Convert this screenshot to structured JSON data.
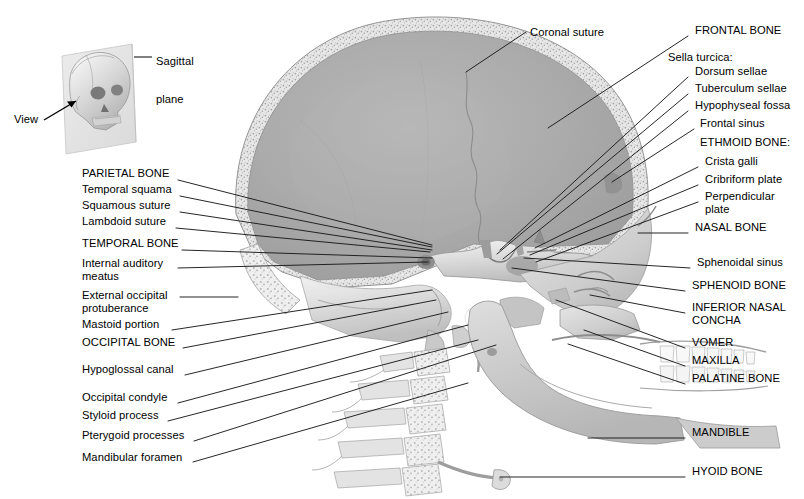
{
  "figure": {
    "view_type": "midsagittal section, medial view of right half",
    "inset": {
      "name": "orientation-inset",
      "plane_label": "Sagittal\nplane",
      "plane_label_lines": [
        "Sagittal",
        "plane"
      ],
      "view_label": "View",
      "description": "three-quarter view skull intersected by a vertical sagittal plane"
    },
    "colors": {
      "background": "#ffffff",
      "leader_line": "#1a1a1a",
      "text": "#000000",
      "cranial_cavity_fill": "#a9a9a9",
      "bone_light": "#e8e8e8",
      "bone_mid": "#cfcfcf",
      "bone_dark": "#9a9a9a",
      "diploe_speckle": "#b5b5b5",
      "plane_panel": "#e3e3e3",
      "tooth_white": "#f7f7f7"
    }
  },
  "labels": {
    "top": [
      {
        "id": "coronal-suture",
        "text": "Coronal suture",
        "side": "top",
        "text_x": 530,
        "text_y": 35,
        "line": [
          [
            526,
            32
          ],
          [
            466,
            72
          ]
        ]
      }
    ],
    "left": [
      {
        "id": "parietal-bone",
        "text": "PARIETAL BONE",
        "emphasis": "caps",
        "text_x": 82,
        "text_y": 176,
        "line": [
          [
            178,
            180
          ],
          [
            432,
            245
          ]
        ]
      },
      {
        "id": "temporal-squama",
        "text": "Temporal squama",
        "emphasis": "normal",
        "text_x": 82,
        "text_y": 192,
        "line": [
          [
            180,
            196
          ],
          [
            432,
            247
          ]
        ]
      },
      {
        "id": "squamous-suture",
        "text": "Squamous suture",
        "emphasis": "normal",
        "text_x": 82,
        "text_y": 208,
        "line": [
          [
            180,
            212
          ],
          [
            432,
            250
          ]
        ]
      },
      {
        "id": "lambdoid-suture",
        "text": "Lambdoid suture",
        "emphasis": "normal",
        "text_x": 82,
        "text_y": 224,
        "line": [
          [
            176,
            228
          ],
          [
            430,
            252
          ]
        ]
      },
      {
        "id": "temporal-bone",
        "text": "TEMPORAL BONE",
        "emphasis": "caps",
        "text_x": 82,
        "text_y": 246,
        "line": [
          [
            182,
            250
          ],
          [
            432,
            258
          ]
        ]
      },
      {
        "id": "internal-auditory-meatus",
        "text": "Internal auditory\nmeatus",
        "emphasis": "normal",
        "lines": [
          "Internal auditory",
          "meatus"
        ],
        "text_x": 82,
        "text_y": 266,
        "line": [
          [
            178,
            268
          ],
          [
            428,
            262
          ]
        ]
      },
      {
        "id": "external-occipital-protuberance",
        "text": "External occipital\nprotuberance",
        "emphasis": "normal",
        "lines": [
          "External occipital",
          "protuberance"
        ],
        "text_x": 82,
        "text_y": 298,
        "line": [
          [
            180,
            297
          ],
          [
            238,
            297
          ]
        ]
      },
      {
        "id": "mastoid-portion",
        "text": "Mastoid portion",
        "emphasis": "normal",
        "text_x": 82,
        "text_y": 327,
        "line": [
          [
            172,
            330
          ],
          [
            432,
            290
          ]
        ]
      },
      {
        "id": "occipital-bone",
        "text": "OCCIPITAL BONE",
        "emphasis": "caps",
        "text_x": 82,
        "text_y": 345,
        "line": [
          [
            183,
            348
          ],
          [
            436,
            300
          ]
        ]
      },
      {
        "id": "hypoglossal-canal",
        "text": "Hypoglossal canal",
        "emphasis": "normal",
        "text_x": 82,
        "text_y": 372,
        "line": [
          [
            185,
            375
          ],
          [
            448,
            312
          ]
        ]
      },
      {
        "id": "occipital-condyle",
        "text": "Occipital condyle",
        "emphasis": "normal",
        "text_x": 82,
        "text_y": 400,
        "line": [
          [
            178,
            403
          ],
          [
            468,
            325
          ]
        ]
      },
      {
        "id": "styloid-process",
        "text": "Styloid process",
        "emphasis": "normal",
        "text_x": 82,
        "text_y": 418,
        "line": [
          [
            168,
            421
          ],
          [
            478,
            340
          ]
        ]
      },
      {
        "id": "pterygoid-processes",
        "text": "Pterygoid processes",
        "emphasis": "normal",
        "text_x": 82,
        "text_y": 438,
        "line": [
          [
            194,
            441
          ],
          [
            496,
            345
          ]
        ]
      },
      {
        "id": "mandibular-foramen",
        "text": "Mandibular foramen",
        "emphasis": "normal",
        "text_x": 82,
        "text_y": 460,
        "line": [
          [
            193,
            462
          ],
          [
            468,
            383
          ]
        ]
      }
    ],
    "right": [
      {
        "id": "frontal-bone",
        "text": "FRONTAL BONE",
        "emphasis": "caps",
        "indent": 0,
        "text_x": 695,
        "text_y": 33,
        "line": [
          [
            688,
            36
          ],
          [
            548,
            128
          ]
        ]
      },
      {
        "id": "sella-turcica-group",
        "text": "Sella turcica:",
        "emphasis": "normal",
        "indent": 1,
        "is_group_header": true,
        "text_x": 668,
        "text_y": 60,
        "line": null
      },
      {
        "id": "dorsum-sellae",
        "text": "Dorsum sellae",
        "emphasis": "normal",
        "indent": 2,
        "text_x": 695,
        "text_y": 74,
        "line": [
          [
            688,
            77
          ],
          [
            500,
            250
          ]
        ]
      },
      {
        "id": "tuberculum-sellae",
        "text": "Tuberculum sellae",
        "emphasis": "normal",
        "indent": 2,
        "text_x": 695,
        "text_y": 91,
        "line": [
          [
            688,
            94
          ],
          [
            497,
            254
          ]
        ]
      },
      {
        "id": "hypophyseal-fossa",
        "text": "Hypophyseal fossa",
        "emphasis": "normal",
        "indent": 2,
        "text_x": 695,
        "text_y": 108,
        "line": [
          [
            688,
            111
          ],
          [
            503,
            259
          ]
        ]
      },
      {
        "id": "frontal-sinus",
        "text": "Frontal sinus",
        "emphasis": "normal",
        "indent": 3,
        "text_x": 700,
        "text_y": 126,
        "line": [
          [
            694,
            129
          ],
          [
            612,
            182
          ]
        ]
      },
      {
        "id": "ethmoid-bone-group",
        "text": "ETHMOID BONE:",
        "emphasis": "caps",
        "indent": 3,
        "is_group_header": true,
        "text_x": 700,
        "text_y": 145,
        "line": null
      },
      {
        "id": "crista-galli",
        "text": "Crista galli",
        "emphasis": "normal",
        "indent": 4,
        "text_x": 705,
        "text_y": 164,
        "line": [
          [
            698,
            167
          ],
          [
            535,
            248
          ]
        ]
      },
      {
        "id": "cribriform-plate",
        "text": "Cribriform plate",
        "emphasis": "normal",
        "indent": 4,
        "text_x": 705,
        "text_y": 182,
        "line": [
          [
            698,
            185
          ],
          [
            530,
            255
          ]
        ]
      },
      {
        "id": "perpendicular-plate",
        "text": "Perpendicular\nplate",
        "emphasis": "normal",
        "indent": 4,
        "lines": [
          "Perpendicular",
          "plate"
        ],
        "text_x": 705,
        "text_y": 199,
        "line": [
          [
            698,
            202
          ],
          [
            536,
            262
          ]
        ]
      },
      {
        "id": "nasal-bone",
        "text": "NASAL BONE",
        "emphasis": "caps",
        "indent": 3,
        "text_x": 695,
        "text_y": 230,
        "line": [
          [
            688,
            233
          ],
          [
            638,
            233
          ]
        ]
      },
      {
        "id": "sphenoidal-sinus",
        "text": "Sphenoidal sinus",
        "emphasis": "normal",
        "indent": 3,
        "text_x": 697,
        "text_y": 265,
        "line": [
          [
            690,
            268
          ],
          [
            524,
            258
          ]
        ]
      },
      {
        "id": "sphenoid-bone",
        "text": "SPHENOID BONE",
        "emphasis": "caps",
        "indent": 2,
        "text_x": 692,
        "text_y": 288,
        "line": [
          [
            685,
            291
          ],
          [
            512,
            268
          ]
        ]
      },
      {
        "id": "inferior-nasal-concha",
        "text": "INFERIOR NASAL\nCONCHA",
        "emphasis": "caps",
        "indent": 2,
        "lines": [
          "INFERIOR NASAL",
          "CONCHA"
        ],
        "text_x": 692,
        "text_y": 310,
        "line": [
          [
            685,
            313
          ],
          [
            590,
            295
          ]
        ]
      },
      {
        "id": "vomer",
        "text": "VOMER",
        "emphasis": "caps",
        "indent": 2,
        "text_x": 692,
        "text_y": 345,
        "line": [
          [
            685,
            348
          ],
          [
            556,
            300
          ]
        ]
      },
      {
        "id": "maxilla",
        "text": "MAXILLA",
        "emphasis": "caps",
        "indent": 2,
        "text_x": 692,
        "text_y": 363,
        "line": [
          [
            685,
            366
          ],
          [
            584,
            330
          ]
        ]
      },
      {
        "id": "palatine-bone",
        "text": "PALATINE BONE",
        "emphasis": "caps",
        "indent": 2,
        "text_x": 692,
        "text_y": 381,
        "line": [
          [
            685,
            384
          ],
          [
            568,
            344
          ]
        ]
      },
      {
        "id": "mandible",
        "text": "MANDIBLE",
        "emphasis": "caps",
        "indent": 2,
        "text_x": 692,
        "text_y": 435,
        "line": [
          [
            685,
            438
          ],
          [
            588,
            438
          ]
        ]
      },
      {
        "id": "hyoid-bone",
        "text": "HYOID BONE",
        "emphasis": "caps",
        "indent": 2,
        "text_x": 692,
        "text_y": 474,
        "line": [
          [
            685,
            477
          ],
          [
            500,
            477
          ]
        ]
      }
    ]
  },
  "counts": {
    "total_labels": 34,
    "left_labels": 14,
    "right_labels": 19,
    "top_labels": 1
  }
}
